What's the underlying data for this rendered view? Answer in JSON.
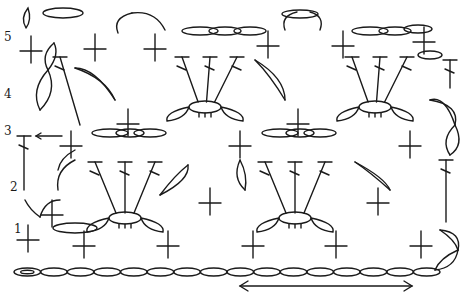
{
  "diagram": {
    "type": "crochet-stitch-chart",
    "row_labels": [
      {
        "text": "5",
        "x": 4,
        "y": 40
      },
      {
        "text": "4",
        "x": 4,
        "y": 97
      },
      {
        "text": "3",
        "x": 4,
        "y": 134
      },
      {
        "text": "2",
        "x": 10,
        "y": 190
      },
      {
        "text": "1",
        "x": 14,
        "y": 232
      }
    ],
    "foundation_chain": {
      "x_start": 14,
      "x_end": 440,
      "y": 272,
      "count": 16
    },
    "repeat_arrow": {
      "x1": 240,
      "x2": 412,
      "y": 286
    },
    "row3_arrow": {
      "x1": 62,
      "x2": 36,
      "y": 136
    },
    "single_crochet": [
      {
        "x": 28,
        "y": 240
      },
      {
        "x": 84,
        "y": 246
      },
      {
        "x": 168,
        "y": 246
      },
      {
        "x": 253,
        "y": 246
      },
      {
        "x": 336,
        "y": 246
      },
      {
        "x": 421,
        "y": 246
      },
      {
        "x": 52,
        "y": 215
      },
      {
        "x": 128,
        "y": 124
      },
      {
        "x": 298,
        "y": 124
      },
      {
        "x": 210,
        "y": 203
      },
      {
        "x": 378,
        "y": 203
      },
      {
        "x": 31,
        "y": 51
      },
      {
        "x": 95,
        "y": 49
      },
      {
        "x": 155,
        "y": 49
      },
      {
        "x": 268,
        "y": 46
      },
      {
        "x": 343,
        "y": 46
      },
      {
        "x": 424,
        "y": 42
      },
      {
        "x": 71,
        "y": 146
      },
      {
        "x": 240,
        "y": 146
      },
      {
        "x": 410,
        "y": 146
      }
    ],
    "dc_fans": [
      {
        "cx": 125,
        "cy": 218,
        "tops": [
          [
            95,
            162
          ],
          [
            125,
            162
          ],
          [
            155,
            162
          ]
        ]
      },
      {
        "cx": 295,
        "cy": 218,
        "tops": [
          [
            265,
            162
          ],
          [
            295,
            162
          ],
          [
            325,
            162
          ]
        ]
      },
      {
        "cx": 205,
        "cy": 107,
        "tops": [
          [
            182,
            57
          ],
          [
            210,
            57
          ],
          [
            237,
            57
          ]
        ]
      },
      {
        "cx": 375,
        "cy": 107,
        "tops": [
          [
            352,
            57
          ],
          [
            380,
            57
          ],
          [
            407,
            57
          ]
        ]
      }
    ],
    "tall_dc": [
      {
        "x1": 60,
        "y1": 57,
        "x2": 80,
        "y2": 125
      },
      {
        "x1": 24,
        "y1": 136,
        "x2": 24,
        "y2": 190
      },
      {
        "x1": 450,
        "y1": 60,
        "x2": 450,
        "y2": 88
      },
      {
        "x1": 446,
        "y1": 160,
        "x2": 446,
        "y2": 222
      }
    ],
    "chain_loops": [
      {
        "cx": 63,
        "cy": 13,
        "rx": 20,
        "ry": 5
      },
      {
        "cx": 200,
        "cy": 31,
        "rx": 18,
        "ry": 4
      },
      {
        "cx": 225,
        "cy": 31,
        "rx": 16,
        "ry": 4
      },
      {
        "cx": 250,
        "cy": 31,
        "rx": 16,
        "ry": 4
      },
      {
        "cx": 300,
        "cy": 14,
        "rx": 18,
        "ry": 4
      },
      {
        "cx": 370,
        "cy": 31,
        "rx": 18,
        "ry": 4
      },
      {
        "cx": 395,
        "cy": 31,
        "rx": 16,
        "ry": 4
      },
      {
        "cx": 418,
        "cy": 29,
        "rx": 14,
        "ry": 4
      },
      {
        "cx": 110,
        "cy": 133,
        "rx": 18,
        "ry": 4
      },
      {
        "cx": 130,
        "cy": 133,
        "rx": 14,
        "ry": 4
      },
      {
        "cx": 150,
        "cy": 133,
        "rx": 16,
        "ry": 4
      },
      {
        "cx": 280,
        "cy": 133,
        "rx": 18,
        "ry": 4
      },
      {
        "cx": 300,
        "cy": 133,
        "rx": 14,
        "ry": 4
      },
      {
        "cx": 320,
        "cy": 133,
        "rx": 16,
        "ry": 4
      },
      {
        "cx": 75,
        "cy": 228,
        "rx": 22,
        "ry": 5
      },
      {
        "cx": 430,
        "cy": 55,
        "rx": 12,
        "ry": 4
      }
    ]
  }
}
